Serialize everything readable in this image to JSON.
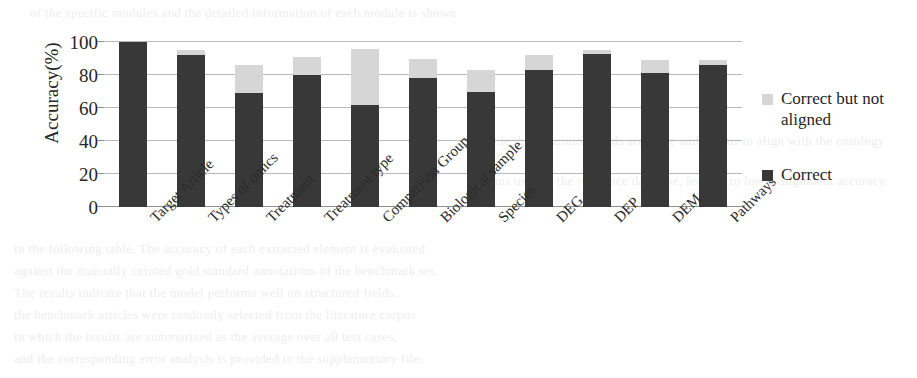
{
  "figure": {
    "y_axis_title": "Accuracy(%)",
    "y_tick_labels": [
      "100",
      "80",
      "60",
      "40",
      "20",
      "0"
    ],
    "legend": [
      {
        "label": "Correct but not aligned",
        "color": "#d6d6d6",
        "key": "not_aligned"
      },
      {
        "label": "Correct",
        "color": "#383838",
        "key": "correct"
      }
    ]
  },
  "chart_data": {
    "type": "bar",
    "stacked": true,
    "title": "",
    "xlabel": "",
    "ylabel": "Accuracy(%)",
    "ylim": [
      0,
      100
    ],
    "yticks": [
      0,
      20,
      40,
      60,
      80,
      100
    ],
    "grid": true,
    "legend_position": "right",
    "categories": [
      "Target Article",
      "Types of omics",
      "Treatment",
      "Treatment type",
      "Comparison Group",
      "Biological sample",
      "Species",
      "DEG",
      "DEP",
      "DEM",
      "Pathways"
    ],
    "series": [
      {
        "name": "Correct",
        "color": "#383838",
        "values": [
          100,
          92,
          69,
          80,
          62,
          78,
          70,
          83,
          93,
          81,
          86
        ]
      },
      {
        "name": "Correct but not aligned",
        "color": "#d6d6d6",
        "values": [
          0,
          3,
          17,
          11,
          34,
          12,
          13,
          9,
          2,
          8,
          3
        ]
      }
    ],
    "totals": [
      100,
      95,
      86,
      91,
      96,
      90,
      83,
      92,
      95,
      89,
      89
    ]
  },
  "page_background_text": {
    "lines": [
      "of  the  specific  modules  and  the  detailed  information  of  each  module  is  shown",
      "in  the  following  table.  The  accuracy  of  each  extracted  element  is  evaluated",
      "against  the  manually  curated  gold  standard  annotations  of  the  benchmark  set.",
      "The  results  indicate  that  the  model  performs  well  on  structured  fields.",
      "the  benchmark  articles  were  randomly  selected  from  the  literature  corpus",
      "in  which  the  results  are  summarized  as  the  average  over  all  test  cases,",
      "and  the  corresponding  error  analysis  is  provided  in  the  supplementary  file.",
      "while  the  remaining  fields  are  more  ambiguous  to  align  with  the  ontology",
      "terms  used  in  the  reference  database,  leading  to  lower  alignment  accuracy."
    ]
  }
}
